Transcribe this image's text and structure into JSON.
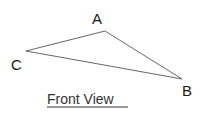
{
  "diagram": {
    "caption": "Front View",
    "vertices": [
      {
        "name": "A",
        "label": "A",
        "x": 105,
        "y": 31
      },
      {
        "name": "B",
        "label": "B",
        "x": 182,
        "y": 79
      },
      {
        "name": "C",
        "label": "C",
        "x": 26,
        "y": 51
      }
    ],
    "edges": [
      [
        "A",
        "B"
      ],
      [
        "B",
        "C"
      ],
      [
        "C",
        "A"
      ]
    ],
    "line_color": "#555555"
  }
}
